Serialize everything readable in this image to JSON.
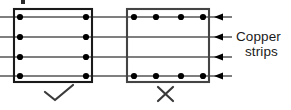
{
  "figure": {
    "width": 291,
    "height": 110,
    "background_color": "#ffffff",
    "line_color": "#555555",
    "rect_color": "#1a1a1a",
    "dot_color": "#000000",
    "arrow_color": "#000000"
  },
  "annotations": {
    "copper_label_line1": "Copper",
    "copper_label_line2": "strips",
    "correct_mark": "check-mark",
    "incorrect_mark": "cross-mark"
  },
  "diagram_data": {
    "type": "technical-diagram",
    "strip_lines": [
      {
        "id": 1,
        "y": 17
      },
      {
        "id": 2,
        "y": 37
      },
      {
        "id": 3,
        "y": 57
      },
      {
        "id": 4,
        "y": 76
      }
    ],
    "line_start_x": 0,
    "line_end_x": 232,
    "panels": [
      {
        "name": "left-panel",
        "verdict": "correct",
        "x": 14,
        "y": 9,
        "width": 78,
        "height": 73,
        "dot_rows": [
          {
            "line": 1,
            "dots_x": [
              20,
              86
            ]
          },
          {
            "line": 2,
            "dots_x": [
              20,
              86
            ]
          },
          {
            "line": 3,
            "dots_x": [
              20,
              86
            ]
          },
          {
            "line": 4,
            "dots_x": [
              20,
              86
            ]
          }
        ]
      },
      {
        "name": "right-panel",
        "verdict": "incorrect",
        "x": 127,
        "y": 9,
        "width": 82,
        "height": 73,
        "dot_rows": [
          {
            "line": 1,
            "dots_x": [
              134,
              156,
              181,
              203
            ]
          },
          {
            "line": 4,
            "dots_x": [
              134,
              156,
              181,
              203
            ]
          }
        ]
      }
    ],
    "arrows": [
      {
        "line": 1,
        "x_tip": 216,
        "x_tail": 232,
        "direction": "left"
      },
      {
        "line": 2,
        "x_tip": 216,
        "x_tail": 232,
        "direction": "left"
      },
      {
        "line": 3,
        "x_tip": 216,
        "x_tail": 232,
        "direction": "left"
      },
      {
        "line": 4,
        "x_tip": 216,
        "x_tail": 232,
        "direction": "left"
      }
    ]
  }
}
